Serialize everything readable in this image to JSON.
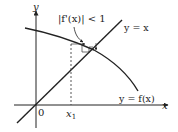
{
  "diagram": {
    "axes": {
      "x_label": "x",
      "y_label": "y",
      "origin_label": "0"
    },
    "curves": [
      {
        "name": "identity-line",
        "label": "y = x"
      },
      {
        "name": "function-curve",
        "label": "y = f(x)"
      }
    ],
    "annotations": {
      "condition": "|f'(x)| < 1",
      "start_point": "x",
      "start_point_subscript": "1"
    },
    "colors": {
      "line": "#222222",
      "background": "#ffffff"
    }
  }
}
